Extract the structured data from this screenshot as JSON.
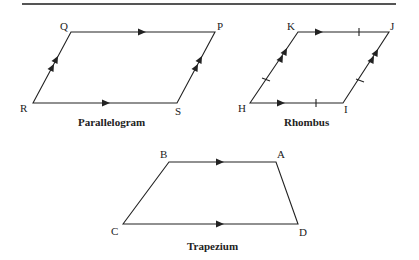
{
  "figures": {
    "parallelogram": {
      "caption": "Parallelogram",
      "vertices": {
        "Q": "Q",
        "P": "P",
        "R": "R",
        "S": "S"
      }
    },
    "rhombus": {
      "caption": "Rhombus",
      "vertices": {
        "K": "K",
        "J": "J",
        "H": "H",
        "I": "I"
      }
    },
    "trapezium": {
      "caption": "Trapezium",
      "vertices": {
        "B": "B",
        "A": "A",
        "C": "C",
        "D": "D"
      }
    }
  },
  "colors": {
    "ink": "#222222",
    "rule": "#555555"
  }
}
